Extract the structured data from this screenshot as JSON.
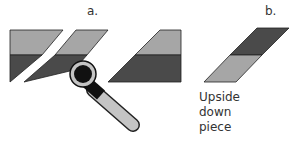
{
  "panels": {
    "a": {
      "label": "a."
    },
    "b": {
      "label": "b.",
      "caption": [
        "Upside",
        "down",
        "piece"
      ]
    }
  },
  "colors": {
    "light": "#a6a6a6",
    "dark": "#4a4a4a",
    "outline": "#222222",
    "cutter_handle": "#c4c4c4"
  }
}
